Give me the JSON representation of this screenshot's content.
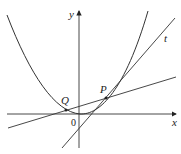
{
  "diagram": {
    "type": "math-graph",
    "axes": {
      "x_label": "x",
      "y_label": "y",
      "origin_label": "0"
    },
    "points": [
      {
        "name": "P",
        "label": "P"
      },
      {
        "name": "Q",
        "label": "Q"
      }
    ],
    "lines": [
      {
        "name": "tangent",
        "label": "t"
      },
      {
        "name": "secant-QP",
        "label": ""
      }
    ],
    "curve": {
      "name": "parabola"
    },
    "colors": {
      "stroke": "#333333",
      "background": "#ffffff"
    }
  }
}
